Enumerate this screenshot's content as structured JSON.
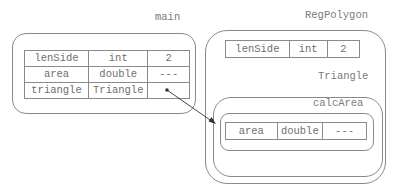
{
  "frames": {
    "main": {
      "label": "main",
      "variables": [
        {
          "name": "lenSide",
          "type": "int",
          "value": "2"
        },
        {
          "name": "area",
          "type": "double",
          "value": "---"
        },
        {
          "name": "triangle",
          "type": "Triangle",
          "value": ""
        }
      ]
    },
    "regpolygon": {
      "label": "RegPolygon",
      "variables": [
        {
          "name": "lenSide",
          "type": "int",
          "value": "2"
        }
      ]
    },
    "triangle": {
      "label": "Triangle"
    },
    "calcarea": {
      "label": "calcArea",
      "variables": [
        {
          "name": "area",
          "type": "double",
          "value": "---"
        }
      ]
    }
  },
  "reference_arrow": {
    "from": "main.triangle",
    "to": "Triangle object"
  },
  "colors": {
    "line": "#8a8a8a",
    "text": "#6e6e6e",
    "arrow": "#333333"
  }
}
